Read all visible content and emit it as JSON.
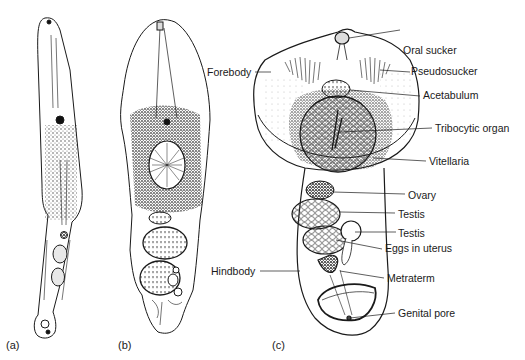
{
  "figure": {
    "panels": [
      {
        "id": "a",
        "label": "(a)"
      },
      {
        "id": "b",
        "label": "(b)"
      },
      {
        "id": "c",
        "label": "(c)"
      }
    ],
    "labels": {
      "oral_sucker": "Oral sucker",
      "pseudosucker": "Pseudosucker",
      "acetabulum": "Acetabulum",
      "tribocytic_organ": "Tribocytic organ",
      "vitellaria": "Vitellaria",
      "ovary": "Ovary",
      "testis_1": "Testis",
      "testis_2": "Testis",
      "eggs_in_uterus": "Eggs in uterus",
      "metraterm": "Metraterm",
      "genital_pore": "Genital pore",
      "forebody": "Forebody",
      "hindbody": "Hindbody"
    },
    "colors": {
      "ink": "#1a1a1a",
      "background": "#ffffff"
    }
  }
}
